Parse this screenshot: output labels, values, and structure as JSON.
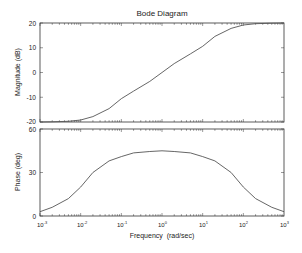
{
  "chart_data": [
    {
      "type": "line",
      "title": "Bode Diagram",
      "xlabel": "",
      "ylabel": "Magnitude (dB)",
      "xscale": "log",
      "xlim": [
        0.001,
        1000
      ],
      "ylim": [
        -20,
        20
      ],
      "yticks": [
        -20,
        -10,
        0,
        10,
        20
      ],
      "grid": false,
      "series": [
        {
          "name": "Magnitude",
          "x": [
            0.001,
            0.002,
            0.005,
            0.01,
            0.02,
            0.05,
            0.1,
            0.2,
            0.5,
            1,
            2,
            5,
            10,
            20,
            50,
            100,
            200,
            500,
            1000
          ],
          "values": [
            -20,
            -19.9,
            -19.7,
            -19.2,
            -17.8,
            -14.6,
            -10.6,
            -7.5,
            -3.6,
            0,
            3.6,
            7.5,
            10.6,
            14.6,
            17.8,
            19.2,
            19.7,
            19.9,
            20
          ]
        }
      ]
    },
    {
      "type": "line",
      "title": "",
      "xlabel": "Frequency  (rad/sec)",
      "ylabel": "Phase (deg)",
      "xscale": "log",
      "xlim": [
        0.001,
        1000
      ],
      "xticks": [
        "10^-3",
        "10^-2",
        "10^-1",
        "10^0",
        "10^1",
        "10^2",
        "10^3"
      ],
      "ylim": [
        0,
        60
      ],
      "yticks": [
        0,
        30,
        60
      ],
      "grid": false,
      "series": [
        {
          "name": "Phase",
          "x": [
            0.001,
            0.002,
            0.005,
            0.01,
            0.02,
            0.05,
            0.1,
            0.2,
            0.5,
            1,
            2,
            5,
            10,
            20,
            50,
            100,
            200,
            500,
            1000
          ],
          "values": [
            3,
            6,
            12,
            20,
            30,
            38,
            41,
            43.5,
            44.5,
            45,
            44.5,
            43.5,
            41,
            38,
            30,
            20,
            12,
            6,
            3
          ]
        }
      ]
    }
  ],
  "labels": {
    "title": "Bode Diagram",
    "mag_ylabel": "Magnitude (dB)",
    "phase_ylabel": "Phase (deg)",
    "xlabel": "Frequency  (rad/sec)",
    "mag_ticks": [
      "20",
      "10",
      "0",
      "-10",
      "-20"
    ],
    "phase_ticks": [
      "60",
      "30",
      "0"
    ],
    "x_ticks_base": "10",
    "x_ticks_exp": [
      "-3",
      "-2",
      "-1",
      "0",
      "1",
      "2",
      "3"
    ]
  },
  "colors": {
    "axes": "#333333",
    "line": "#555555"
  }
}
